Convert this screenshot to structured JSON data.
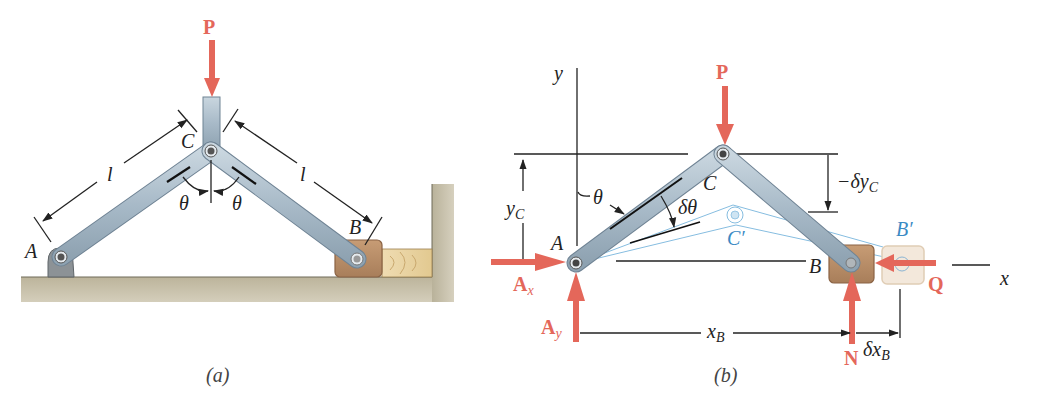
{
  "figure_a": {
    "caption": "(a)",
    "labels": {
      "force_p": "P",
      "joint_a": "A",
      "joint_b": "B",
      "joint_c": "C",
      "length_left": "l",
      "length_right": "l",
      "angle_left": "θ",
      "angle_right": "θ"
    }
  },
  "figure_b": {
    "caption": "(b)",
    "labels": {
      "axis_y": "y",
      "axis_x": "x",
      "force_p": "P",
      "force_q": "Q",
      "force_n": "N",
      "force_ax_main": "A",
      "force_ax_sub": "x",
      "force_ay_main": "A",
      "force_ay_sub": "y",
      "joint_a": "A",
      "joint_b": "B",
      "joint_c": "C",
      "joint_c_prime": "C′",
      "joint_b_prime": "B′",
      "angle_theta": "θ",
      "angle_delta_theta": "δθ",
      "dim_yc_main": "y",
      "dim_yc_sub": "C",
      "dim_xb_main": "x",
      "dim_xb_sub": "B",
      "dim_dxb_main": "δx",
      "dim_dxb_sub": "B",
      "dim_dyc_main": "−δy",
      "dim_dyc_sub": "C"
    }
  },
  "colors": {
    "force_red": "#e4675a",
    "member_blue": "#a9bccb",
    "virtual_blue": "#3b8ac4",
    "ground": "#b5ad94",
    "block_brown": "#b58d6a",
    "wood": "#e9d3a6"
  }
}
